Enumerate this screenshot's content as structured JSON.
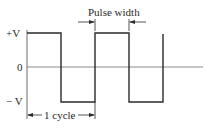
{
  "diagram": {
    "labels": {
      "plus_v": "+V",
      "zero": "0",
      "minus_v": "− V",
      "pulse_width": "Pulse width",
      "one_cycle": "1 cycle"
    },
    "levels": {
      "plus_v_y": 33,
      "zero_y": 67,
      "minus_v_y": 102
    },
    "transitions_x": [
      27,
      61,
      95,
      129,
      163
    ],
    "colors": {
      "line": "#2a2a2a",
      "axis": "#7a7a7a",
      "background": "#ffffff"
    }
  }
}
